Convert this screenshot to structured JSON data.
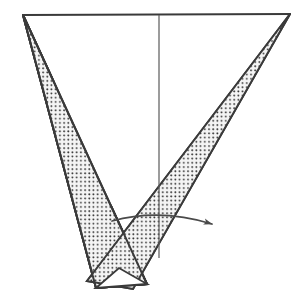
{
  "figure": {
    "canvas": {
      "width": 308,
      "height": 300,
      "background": "#ffffff"
    },
    "style": {
      "stroke_color": "#3a3a3a",
      "stroke_width": 2,
      "thin_stroke_width": 1.2,
      "fill_pattern": "dot-stipple",
      "dot_color": "#2e2e2e",
      "dot_spacing": 4.2,
      "dot_radius": 0.95,
      "band_background": "#f2f2f2"
    },
    "vertices": {
      "top_left_apex": [
        23,
        15
      ],
      "top_right_apex": [
        290,
        14
      ],
      "left_band_inner_top": [
        30,
        15
      ],
      "left_band_bottom_outer": [
        96,
        288
      ],
      "left_band_bottom_inner": [
        147,
        284
      ],
      "right_band_bottom_outer": [
        87,
        281
      ],
      "right_band_bottom_inner": [
        133,
        289
      ],
      "v_notch_vertex": [
        104,
        213
      ],
      "crossing_point": [
        128,
        236
      ],
      "axis_top": [
        159,
        15
      ],
      "axis_bottom": [
        159,
        258
      ]
    },
    "shapes": [
      {
        "name": "top-edge-line",
        "kind": "line",
        "points": [
          [
            23,
            15
          ],
          [
            290,
            14
          ]
        ]
      },
      {
        "name": "left-stippled-band",
        "kind": "polygon",
        "points": [
          [
            23,
            15
          ],
          [
            147,
            284
          ],
          [
            96,
            288
          ]
        ]
      },
      {
        "name": "right-stippled-band",
        "kind": "polygon",
        "points": [
          [
            290,
            14
          ],
          [
            133,
            289
          ],
          [
            87,
            281
          ]
        ]
      },
      {
        "name": "vertical-axis-line",
        "kind": "line",
        "points": [
          [
            159,
            15
          ],
          [
            159,
            258
          ]
        ]
      },
      {
        "name": "bottom-white-triangle",
        "kind": "polygon",
        "points": [
          [
            96,
            288
          ],
          [
            147,
            284
          ],
          [
            119,
            268
          ]
        ]
      }
    ],
    "arrow": {
      "name": "rotation-arrow",
      "kind": "curved-arrow",
      "arc_start": [
        112,
        221
      ],
      "arc_control": [
        160,
        208
      ],
      "arc_end": [
        212,
        224
      ],
      "head_tip": [
        213,
        224
      ],
      "head_length": 11,
      "head_width": 6,
      "direction": "clockwise-right",
      "meaning": "direction of rotation / sweep"
    },
    "labels": []
  }
}
